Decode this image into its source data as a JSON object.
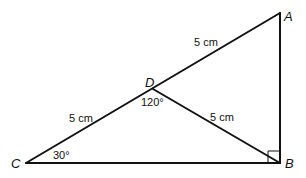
{
  "diagram": {
    "type": "geometry-triangle",
    "stroke_color": "#111111",
    "background": "#ffffff",
    "points": {
      "A": {
        "label": "A",
        "x": 280,
        "y": 13
      },
      "B": {
        "label": "B",
        "x": 280,
        "y": 163
      },
      "C": {
        "label": "C",
        "x": 26,
        "y": 163
      },
      "D": {
        "label": "D",
        "x": 153,
        "y": 89
      }
    },
    "segments": [
      {
        "from": "C",
        "to": "A"
      },
      {
        "from": "A",
        "to": "B"
      },
      {
        "from": "B",
        "to": "C"
      },
      {
        "from": "D",
        "to": "B"
      }
    ],
    "measurements": {
      "AD": "5 cm",
      "CD": "5 cm",
      "DB": "5 cm"
    },
    "angles": {
      "CDB": "120°",
      "ACB": "30°",
      "ABC": "right-angle"
    }
  }
}
